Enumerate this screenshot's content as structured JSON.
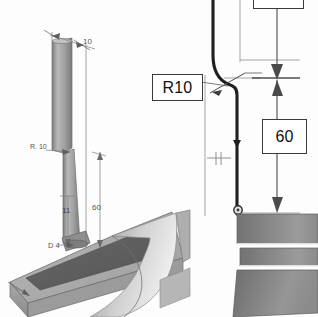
{
  "drawing": {
    "title": "CAD dimension detail view",
    "background_color": "#fdfdfd",
    "callouts": [
      {
        "id": "r10",
        "label": "R10",
        "kind": "boxed-callout",
        "leader": true
      },
      {
        "id": "sixty",
        "label": "60",
        "kind": "boxed-dimension",
        "leader": false
      },
      {
        "id": "top",
        "label": "",
        "kind": "boxed-dimension-clipped",
        "leader": false
      }
    ],
    "iso_annotations": [
      {
        "id": "ten",
        "label": "10"
      },
      {
        "id": "radius",
        "label": "R. 10"
      },
      {
        "id": "eleven",
        "label": "11"
      },
      {
        "id": "sixty",
        "label": "60"
      },
      {
        "id": "dia4",
        "label": "D 4"
      }
    ],
    "colors": {
      "line": "#3a3a3a",
      "thin_line": "#8d8d8d",
      "profile": "#1d1d1d",
      "solid_dark": "#6f6f6f",
      "solid_mid": "#8a8a8a",
      "solid_light": "#b4b4b4",
      "solid_lighter": "#cfcfcf",
      "rod": "#9a9a9a",
      "paper": "#fdfdfd"
    },
    "views": [
      {
        "id": "isometric-view",
        "label": "isometric 3D part view"
      },
      {
        "id": "section-view",
        "label": "section profile view"
      }
    ]
  }
}
